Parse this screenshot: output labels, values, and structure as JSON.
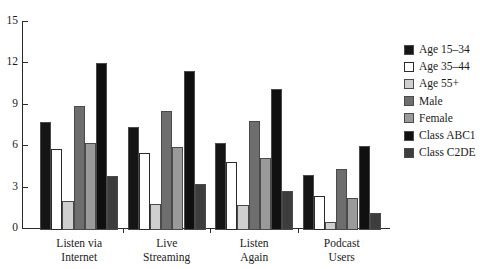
{
  "chart_data": {
    "type": "bar",
    "title": "",
    "subtitle": "",
    "xlabel": "",
    "ylabel": "",
    "ylim": [
      0,
      15
    ],
    "yticks": [
      0,
      3,
      6,
      9,
      12,
      15
    ],
    "grid": false,
    "legend_position": "right",
    "categories": [
      [
        "Listen via",
        "Internet"
      ],
      [
        "Live",
        "Streaming"
      ],
      [
        "Listen",
        "Again"
      ],
      [
        "Podcast",
        "Users"
      ]
    ],
    "category_labels": [
      "Listen via Internet",
      "Live Streaming",
      "Listen Again",
      "Podcast Users"
    ],
    "series": [
      {
        "name": "Age 15–34",
        "color": "#151515",
        "values": [
          7.8,
          7.5,
          6.3,
          4.0
        ]
      },
      {
        "name": "Age 35–44",
        "color": "#ffffff",
        "values": [
          5.9,
          5.6,
          4.9,
          2.5
        ]
      },
      {
        "name": "Age 55+",
        "color": "#cfcfcf",
        "values": [
          2.1,
          1.9,
          1.8,
          0.6
        ]
      },
      {
        "name": "Male",
        "color": "#6e6e6e",
        "values": [
          9.0,
          8.6,
          7.9,
          4.4
        ]
      },
      {
        "name": "Female",
        "color": "#9a9a9a",
        "values": [
          6.3,
          6.0,
          5.2,
          2.3
        ]
      },
      {
        "name": "Class ABC1",
        "color": "#101010",
        "values": [
          12.1,
          11.5,
          10.2,
          6.1
        ]
      },
      {
        "name": "Class C2DE",
        "color": "#3d3d3d",
        "values": [
          3.9,
          3.3,
          2.8,
          1.2
        ]
      }
    ]
  },
  "axis": {
    "y_tick_labels": [
      "0",
      "3",
      "6",
      "9",
      "12",
      "15"
    ]
  },
  "legend": {
    "items": [
      {
        "label": "Age 15–34"
      },
      {
        "label": "Age 35–44"
      },
      {
        "label": "Age 55+"
      },
      {
        "label": "Male"
      },
      {
        "label": "Female"
      },
      {
        "label": "Class ABC1"
      },
      {
        "label": "Class C2DE"
      }
    ]
  }
}
